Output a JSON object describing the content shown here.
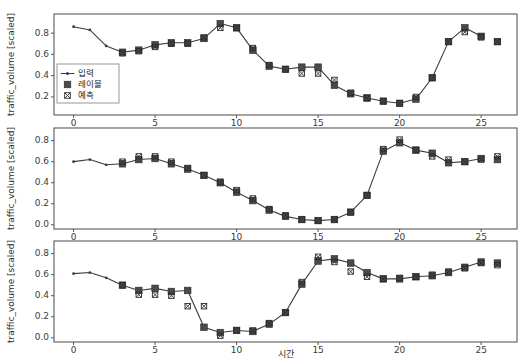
{
  "figure": {
    "width": 528,
    "height": 363,
    "background": "#ffffff",
    "marker_color": "#4a4a4a",
    "line_color": "#3c3c3c",
    "frame_color": "#5a5a5a"
  },
  "legend": {
    "position": "lower-left-panel-1",
    "entries": [
      {
        "label": "입력",
        "marker": "line-with-dot"
      },
      {
        "label": "레이블",
        "marker": "filled-square"
      },
      {
        "label": "예측",
        "marker": "cross-square"
      }
    ]
  },
  "axes": {
    "ylabel": "traffic_volume [scaled]",
    "xlabel": "시간"
  },
  "chart_data": [
    {
      "type": "line",
      "title": "",
      "xlabel": "",
      "ylabel": "traffic_volume [scaled]",
      "xlim": [
        -1.2,
        27.2
      ],
      "ylim": [
        0.03,
        0.98
      ],
      "xticks": [
        0,
        5,
        10,
        15,
        20,
        25
      ],
      "yticks": [
        0.2,
        0.4,
        0.6,
        0.8
      ],
      "ytick_labels": [
        "0.2",
        "0.4",
        "0.6",
        "0.8"
      ],
      "grid": false,
      "legend_position": "lower left",
      "series": [
        {
          "name": "입력",
          "style": "line-with-small-dots",
          "x": [
            0,
            1,
            2,
            3,
            4,
            5,
            6,
            7,
            8,
            9,
            10,
            11,
            12,
            13,
            14,
            15,
            16,
            17,
            18,
            19,
            20,
            21,
            22,
            23,
            24,
            25
          ],
          "values": [
            0.86,
            0.83,
            0.68,
            0.62,
            0.64,
            0.69,
            0.71,
            0.71,
            0.75,
            0.89,
            0.85,
            0.64,
            0.49,
            0.46,
            0.48,
            0.48,
            0.31,
            0.23,
            0.19,
            0.16,
            0.14,
            0.18,
            0.38,
            0.72,
            0.85,
            0.77
          ]
        },
        {
          "name": "레이블",
          "style": "filled-square",
          "x": [
            3,
            4,
            5,
            6,
            7,
            8,
            9,
            10,
            11,
            12,
            13,
            14,
            15,
            16,
            17,
            18,
            19,
            20,
            21,
            22,
            23,
            24,
            25,
            26
          ],
          "values": [
            0.62,
            0.64,
            0.69,
            0.71,
            0.71,
            0.75,
            0.89,
            0.85,
            0.64,
            0.49,
            0.46,
            0.48,
            0.48,
            0.31,
            0.23,
            0.19,
            0.16,
            0.14,
            0.18,
            0.38,
            0.72,
            0.85,
            0.77,
            0.72
          ]
        },
        {
          "name": "예측",
          "style": "cross-square",
          "x": [
            3,
            4,
            5,
            6,
            7,
            8,
            9,
            10,
            11,
            12,
            13,
            14,
            15,
            16,
            17,
            18,
            19,
            20,
            21,
            22,
            23,
            24,
            25,
            26
          ],
          "values": [
            0.61,
            0.63,
            0.67,
            0.7,
            0.7,
            0.76,
            0.85,
            0.85,
            0.66,
            0.5,
            0.46,
            0.42,
            0.42,
            0.36,
            0.24,
            0.19,
            0.16,
            0.14,
            0.2,
            0.38,
            0.72,
            0.81,
            0.76,
            0.72
          ]
        }
      ]
    },
    {
      "type": "line",
      "title": "",
      "xlabel": "",
      "ylabel": "traffic_volume [scaled]",
      "xlim": [
        -1.2,
        27.2
      ],
      "ylim": [
        -0.04,
        0.92
      ],
      "xticks": [
        0,
        5,
        10,
        15,
        20,
        25
      ],
      "yticks": [
        0.0,
        0.2,
        0.4,
        0.6,
        0.8
      ],
      "ytick_labels": [
        "0.0",
        "0.2",
        "0.4",
        "0.6",
        "0.8"
      ],
      "grid": false,
      "series": [
        {
          "name": "입력",
          "style": "line-with-small-dots",
          "x": [
            0,
            1,
            2,
            3,
            4,
            5,
            6,
            7,
            8,
            9,
            10,
            11,
            12,
            13,
            14,
            15,
            16,
            17,
            18,
            19,
            20,
            21,
            22,
            23,
            24,
            25
          ],
          "values": [
            0.6,
            0.62,
            0.57,
            0.58,
            0.62,
            0.63,
            0.58,
            0.53,
            0.47,
            0.4,
            0.31,
            0.23,
            0.14,
            0.08,
            0.05,
            0.04,
            0.05,
            0.12,
            0.28,
            0.7,
            0.78,
            0.71,
            0.68,
            0.59,
            0.6,
            0.63
          ]
        },
        {
          "name": "레이블",
          "style": "filled-square",
          "x": [
            3,
            4,
            5,
            6,
            7,
            8,
            9,
            10,
            11,
            12,
            13,
            14,
            15,
            16,
            17,
            18,
            19,
            20,
            21,
            22,
            23,
            24,
            25,
            26
          ],
          "values": [
            0.58,
            0.62,
            0.63,
            0.58,
            0.53,
            0.47,
            0.4,
            0.31,
            0.23,
            0.14,
            0.08,
            0.05,
            0.04,
            0.05,
            0.12,
            0.28,
            0.7,
            0.78,
            0.71,
            0.68,
            0.59,
            0.6,
            0.63,
            0.62
          ]
        },
        {
          "name": "예측",
          "style": "cross-square",
          "x": [
            3,
            4,
            5,
            6,
            7,
            8,
            9,
            10,
            11,
            12,
            13,
            14,
            15,
            16,
            17,
            18,
            19,
            20,
            21,
            22,
            23,
            24,
            25,
            26
          ],
          "values": [
            0.6,
            0.65,
            0.65,
            0.6,
            0.54,
            0.47,
            0.41,
            0.33,
            0.25,
            0.15,
            0.09,
            0.05,
            0.04,
            0.05,
            0.12,
            0.28,
            0.72,
            0.81,
            0.71,
            0.65,
            0.62,
            0.6,
            0.62,
            0.65
          ]
        }
      ]
    },
    {
      "type": "line",
      "title": "",
      "xlabel": "시간",
      "ylabel": "traffic_volume [scaled]",
      "xlim": [
        -1.2,
        27.2
      ],
      "ylim": [
        -0.04,
        0.92
      ],
      "xticks": [
        0,
        5,
        10,
        15,
        20,
        25
      ],
      "yticks": [
        0.0,
        0.2,
        0.4,
        0.6,
        0.8
      ],
      "ytick_labels": [
        "0.0",
        "0.2",
        "0.4",
        "0.6",
        "0.8"
      ],
      "grid": false,
      "series": [
        {
          "name": "입력",
          "style": "line-with-small-dots",
          "x": [
            0,
            1,
            2,
            3,
            4,
            5,
            6,
            7,
            8,
            9,
            10,
            11,
            12,
            13,
            14,
            15,
            16,
            17,
            18,
            19,
            20,
            21,
            22,
            23,
            24,
            25
          ],
          "values": [
            0.61,
            0.62,
            0.57,
            0.5,
            0.45,
            0.47,
            0.44,
            0.45,
            0.1,
            0.05,
            0.07,
            0.06,
            0.13,
            0.24,
            0.51,
            0.73,
            0.75,
            0.71,
            0.62,
            0.56,
            0.56,
            0.58,
            0.59,
            0.62,
            0.67,
            0.72
          ]
        },
        {
          "name": "레이블",
          "style": "filled-square",
          "x": [
            3,
            4,
            5,
            6,
            7,
            8,
            9,
            10,
            11,
            12,
            13,
            14,
            15,
            16,
            17,
            18,
            19,
            20,
            21,
            22,
            23,
            24,
            25,
            26
          ],
          "values": [
            0.5,
            0.45,
            0.47,
            0.44,
            0.45,
            0.1,
            0.05,
            0.07,
            0.06,
            0.13,
            0.24,
            0.51,
            0.73,
            0.75,
            0.71,
            0.62,
            0.56,
            0.56,
            0.58,
            0.59,
            0.62,
            0.67,
            0.72,
            0.71
          ]
        },
        {
          "name": "예측",
          "style": "cross-square",
          "x": [
            3,
            4,
            5,
            6,
            7,
            8,
            9,
            10,
            11,
            12,
            13,
            14,
            15,
            16,
            17,
            18,
            19,
            20,
            21,
            22,
            23,
            24,
            25,
            26
          ],
          "values": [
            0.5,
            0.41,
            0.41,
            0.4,
            0.3,
            0.3,
            0.02,
            0.07,
            0.07,
            0.14,
            0.24,
            0.53,
            0.77,
            0.72,
            0.63,
            0.58,
            0.56,
            0.57,
            0.58,
            0.6,
            0.63,
            0.66,
            0.71,
            0.69
          ]
        }
      ]
    }
  ]
}
